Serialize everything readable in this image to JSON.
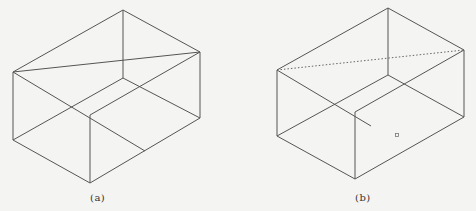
{
  "figures": [
    {
      "id": "a",
      "caption": "(a)",
      "caption_pos": [
        90,
        192
      ],
      "edges": [
        [
          123,
          10,
          200,
          52
        ],
        [
          123,
          10,
          13,
          72
        ],
        [
          123,
          10,
          123,
          78
        ],
        [
          13,
          72,
          200,
          52
        ],
        [
          13,
          72,
          13,
          140
        ],
        [
          13,
          72,
          145,
          151
        ],
        [
          200,
          52,
          200,
          118
        ],
        [
          200,
          52,
          90,
          115
        ],
        [
          13,
          140,
          90,
          183
        ],
        [
          13,
          140,
          123,
          78
        ],
        [
          90,
          115,
          90,
          183
        ],
        [
          90,
          183,
          200,
          118
        ],
        [
          123,
          78,
          200,
          118
        ]
      ],
      "dotted_edges": []
    },
    {
      "id": "b",
      "caption": "(b)",
      "caption_pos": [
        355,
        192
      ],
      "edges": [
        [
          388,
          8,
          464,
          50
        ],
        [
          388,
          8,
          277,
          70
        ],
        [
          388,
          8,
          388,
          75
        ],
        [
          277,
          70,
          277,
          136
        ],
        [
          277,
          70,
          371,
          126
        ],
        [
          464,
          50,
          464,
          117
        ],
        [
          464,
          50,
          355,
          112
        ],
        [
          277,
          136,
          355,
          179
        ],
        [
          277,
          136,
          388,
          75
        ],
        [
          355,
          112,
          355,
          179
        ],
        [
          355,
          179,
          464,
          117
        ],
        [
          388,
          75,
          464,
          117
        ]
      ],
      "dotted_edges": [
        [
          277,
          70,
          464,
          50
        ]
      ],
      "marker": [
        397,
        135
      ]
    }
  ],
  "colors": {
    "line": "#555555",
    "background": "#f4f4f2"
  }
}
